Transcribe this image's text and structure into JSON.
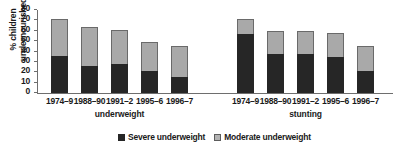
{
  "chart_data": {
    "type": "bar",
    "subtype": "stacked-grouped",
    "title": "",
    "xlabel": "",
    "ylabel": "% children\nundernourished",
    "ylim": [
      0,
      80
    ],
    "yticks": [
      0,
      10,
      20,
      30,
      40,
      50,
      60,
      70,
      80
    ],
    "grid": false,
    "legend_position": "bottom",
    "categories": [
      "1974–9",
      "1988–90",
      "1991–2",
      "1995–6",
      "1996–7"
    ],
    "groups": [
      {
        "name": "underweight",
        "label": "underweight",
        "categories": [
          "1974–9",
          "1988–90",
          "1991–2",
          "1995–6",
          "1996–7"
        ],
        "series": [
          {
            "name": "Severe underweight",
            "color": "#262626",
            "values": [
              36,
              26,
              27.5,
              21,
              15.5
            ]
          },
          {
            "name": "Moderate underweight",
            "color": "#a9a9a9",
            "values": [
              35,
              38,
              33.5,
              28,
              30
            ]
          }
        ],
        "totals": [
          71,
          64,
          61,
          49,
          45.5
        ]
      },
      {
        "name": "stunting",
        "label": "stunting",
        "categories": [
          "1974–9",
          "1988–90",
          "1991–2",
          "1995–6",
          "1996–7"
        ],
        "series": [
          {
            "name": "Severe underweight",
            "color": "#262626",
            "values": [
              57,
              38,
              38,
              35,
              21
            ]
          },
          {
            "name": "Moderate underweight",
            "color": "#a9a9a9",
            "values": [
              14.5,
              22,
              22,
              23,
              24.5
            ]
          }
        ],
        "totals": [
          71.5,
          60,
          60,
          58,
          45.5
        ]
      }
    ],
    "legend": [
      {
        "label": "Severe underweight",
        "color": "#262626",
        "swatch": "filled"
      },
      {
        "label": "Moderate underweight",
        "color": "#b3b3b3",
        "swatch": "outlined"
      }
    ]
  }
}
